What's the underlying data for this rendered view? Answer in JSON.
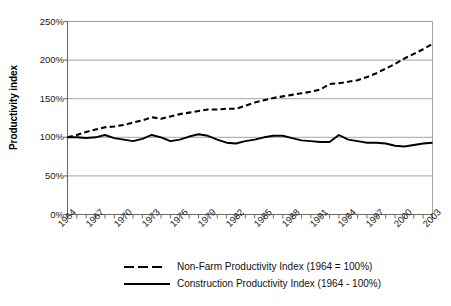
{
  "chart_data": {
    "type": "line",
    "title": "",
    "xlabel": "",
    "ylabel": "Productivity index",
    "ylim": [
      0,
      250
    ],
    "ytick_labels": [
      "250%",
      "200%",
      "150%",
      "100%",
      "50%",
      "0%"
    ],
    "ytick_values": [
      250,
      200,
      150,
      100,
      50,
      0
    ],
    "grid": "horizontal",
    "legend_position": "bottom",
    "x": [
      1964,
      1965,
      1966,
      1967,
      1968,
      1969,
      1970,
      1971,
      1972,
      1973,
      1974,
      1975,
      1976,
      1977,
      1978,
      1979,
      1980,
      1981,
      1982,
      1983,
      1984,
      1985,
      1986,
      1987,
      1988,
      1989,
      1990,
      1991,
      1992,
      1993,
      1994,
      1995,
      1996,
      1997,
      1998,
      1999,
      2000,
      2001,
      2002,
      2003
    ],
    "xtick_labels": [
      "1964",
      "1967",
      "1970",
      "1973",
      "1976",
      "1979",
      "1982",
      "1985",
      "1988",
      "1991",
      "1994",
      "1997",
      "2000",
      "2003"
    ],
    "xtick_values": [
      1964,
      1967,
      1970,
      1973,
      1976,
      1979,
      1982,
      1985,
      1988,
      1991,
      1994,
      1997,
      2000,
      2003
    ],
    "xlim": [
      1964,
      2003
    ],
    "series": [
      {
        "name": "Non-Farm Productivity Index (1964 = 100%)",
        "style": "dashed",
        "color": "#000000",
        "values": [
          100,
          103,
          107,
          110,
          113,
          114,
          116,
          119,
          122,
          126,
          124,
          127,
          130,
          132,
          134,
          136,
          136,
          137,
          137,
          141,
          145,
          148,
          151,
          153,
          155,
          157,
          159,
          162,
          169,
          170,
          172,
          174,
          178,
          183,
          189,
          195,
          202,
          208,
          214,
          221
        ]
      },
      {
        "name": "Construction Productivity Index (1964 - 100%)",
        "style": "solid",
        "color": "#000000",
        "values": [
          100,
          100,
          99,
          100,
          103,
          99,
          97,
          95,
          98,
          103,
          100,
          95,
          97,
          101,
          104,
          102,
          97,
          93,
          92,
          95,
          97,
          100,
          102,
          102,
          99,
          96,
          95,
          94,
          94,
          103,
          97,
          95,
          93,
          93,
          92,
          89,
          88,
          90,
          92,
          93
        ]
      }
    ]
  },
  "legend": {
    "items": [
      {
        "label": "Non-Farm Productivity Index (1964 = 100%)",
        "style": "dashed"
      },
      {
        "label": "Construction Productivity Index (1964 - 100%)",
        "style": "solid"
      }
    ]
  }
}
